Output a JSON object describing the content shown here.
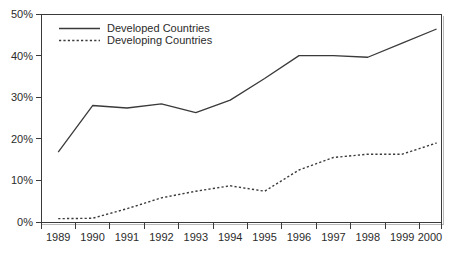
{
  "chart_data": {
    "type": "line",
    "title": "",
    "xlabel": "",
    "ylabel": "",
    "categories": [
      "1989",
      "1990",
      "1991",
      "1992",
      "1993",
      "1994",
      "1995",
      "1996",
      "1997",
      "1998",
      "1999",
      "2000"
    ],
    "x": [
      1989,
      1990,
      1991,
      1992,
      1993,
      1994,
      1995,
      1996,
      1997,
      1998,
      1999,
      2000
    ],
    "series": [
      {
        "name": "Developed Countries",
        "style": "solid",
        "color": "#3a3a3a",
        "values": [
          16.8,
          28.0,
          27.4,
          28.4,
          26.3,
          29.3,
          34.5,
          40.0,
          40.0,
          39.6,
          43.0,
          46.4
        ]
      },
      {
        "name": "Developing Countries",
        "style": "dotted",
        "color": "#3a3a3a",
        "values": [
          0.8,
          0.9,
          3.2,
          5.8,
          7.4,
          8.7,
          7.4,
          12.5,
          15.5,
          16.3,
          16.3,
          19.0
        ]
      }
    ],
    "ylim": [
      0,
      50
    ],
    "yticks": [
      0,
      10,
      20,
      30,
      40,
      50
    ],
    "ytick_labels": [
      "0%",
      "10%",
      "20%",
      "30%",
      "40%",
      "50%"
    ],
    "grid": false,
    "legend_position": "top-left",
    "legend": [
      {
        "label": "Developed Countries",
        "style": "solid"
      },
      {
        "label": "Developing Countries",
        "style": "dotted"
      }
    ]
  },
  "axis": {
    "y_labels": [
      "50%",
      "40%",
      "30%",
      "20%",
      "10%",
      "0%"
    ],
    "x_labels": [
      "1989",
      "1990",
      "1991",
      "1992",
      "1993",
      "1994",
      "1995",
      "1996",
      "1997",
      "1998",
      "1999",
      "2000"
    ]
  },
  "legend": {
    "items": [
      {
        "label": "Developed Countries"
      },
      {
        "label": "Developing Countries"
      }
    ]
  },
  "colors": {
    "line": "#3a3a3a",
    "text": "#2b2b2b",
    "background": "#ffffff",
    "frame": "#3a3a3a",
    "frame_shadow": "#b9b9b9"
  }
}
